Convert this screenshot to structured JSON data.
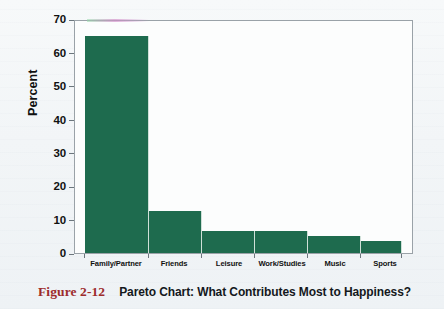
{
  "figure": {
    "number_label": "Figure 2-12",
    "title": "Pareto Chart: What Contributes Most to Happiness?"
  },
  "colors": {
    "bar": "#1e6b4e",
    "figure_number": "#9d2c2c",
    "axis": "#6c767d",
    "plot_background": "#fcfdfd",
    "page_background": "#f3f6f8"
  },
  "axes": {
    "y_title": "Percent",
    "y_ticks": [
      "0",
      "10",
      "20",
      "30",
      "40",
      "50",
      "60",
      "70"
    ]
  },
  "chart_data": {
    "type": "bar",
    "title": "Pareto Chart: What Contributes Most to Happiness?",
    "xlabel": "",
    "ylabel": "Percent",
    "ylim": [
      0,
      70
    ],
    "ytick_values": [
      0,
      10,
      20,
      30,
      40,
      50,
      60,
      70
    ],
    "grid": false,
    "legend": "none",
    "bar_gap": 0,
    "categories": [
      "Family/Partner",
      "Friends",
      "Leisure",
      "Work/Studies",
      "Music",
      "Sports"
    ],
    "values": [
      65,
      12.5,
      6.7,
      6.7,
      5.0,
      3.5
    ]
  }
}
